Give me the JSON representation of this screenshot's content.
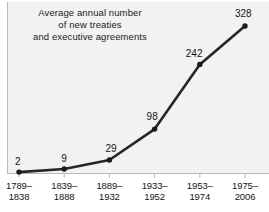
{
  "chart_data": {
    "type": "line",
    "title": "Average annual number of new treaties and executive agreements",
    "title_lines": [
      "Average annual number",
      "of new treaties",
      "and executive agreements"
    ],
    "categories": [
      "1789–1838",
      "1839–1888",
      "1889–1932",
      "1933–1952",
      "1953–1974",
      "1975–2006"
    ],
    "category_lines": [
      {
        "start": "1789–",
        "end": "1838"
      },
      {
        "start": "1839–",
        "end": "1888"
      },
      {
        "start": "1889–",
        "end": "1932"
      },
      {
        "start": "1933–",
        "end": "1952"
      },
      {
        "start": "1953–",
        "end": "1974"
      },
      {
        "start": "1975–",
        "end": "2006"
      }
    ],
    "values": [
      2,
      9,
      29,
      98,
      242,
      328
    ],
    "value_labels": [
      "2",
      "9",
      "29",
      "98",
      "242",
      "328"
    ],
    "xlabel": "",
    "ylabel": "",
    "ylim": [
      0,
      350
    ],
    "grid": false,
    "legend": false,
    "series": [
      {
        "name": "Average annual number of new treaties and executive agreements",
        "values": [
          2,
          9,
          29,
          98,
          242,
          328
        ]
      }
    ],
    "colors": {
      "line": "#262626",
      "marker": "#1a1a1a",
      "plot_background": "#f2f2f2",
      "axis": "#b9b9b9",
      "text": "#141414",
      "figure_background": "#ffffff"
    }
  }
}
